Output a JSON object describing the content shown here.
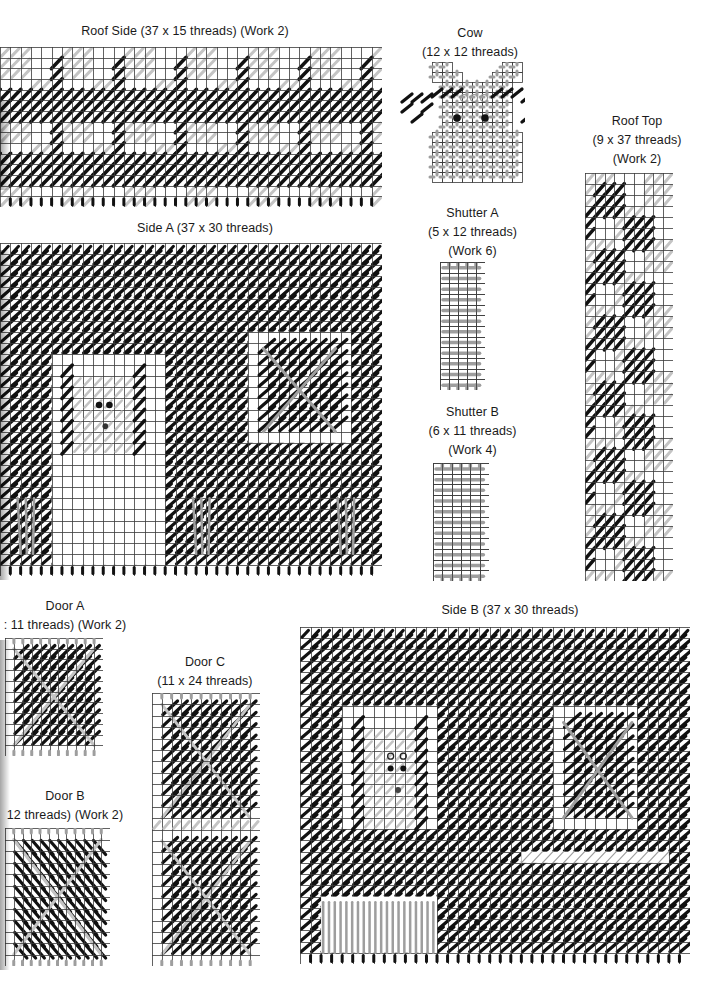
{
  "page": {
    "background": "#ffffff"
  },
  "colors": {
    "grid": "#3a3a3a",
    "dark_stitch": "#111111",
    "gray_stitch": "#9e9e9e",
    "light_stitch": "#c4c4c4"
  },
  "charts": [
    {
      "id": "roof-side",
      "title_lines": [
        "Roof Side (37 x 15 threads) (Work 2)"
      ],
      "threads_w": 37,
      "threads_h": 15,
      "work": 2,
      "title_box": {
        "x": 20,
        "y": 22,
        "w": 330
      },
      "grid_box": {
        "x": 0,
        "y": 47,
        "w": 382,
        "h": 160
      },
      "pattern": "plaid"
    },
    {
      "id": "cow",
      "title_lines": [
        "Cow",
        "(12 x 12 threads)"
      ],
      "threads_w": 12,
      "threads_h": 12,
      "title_box": {
        "x": 405,
        "y": 24,
        "w": 130
      },
      "grid_box": {
        "x": 400,
        "y": 62,
        "w": 125,
        "h": 130
      },
      "pattern": "cow"
    },
    {
      "id": "roof-top",
      "title_lines": [
        "Roof Top",
        "(9 x 37 threads)",
        "(Work 2)"
      ],
      "threads_w": 9,
      "threads_h": 37,
      "work": 2,
      "title_box": {
        "x": 575,
        "y": 112,
        "w": 124
      },
      "grid_box": {
        "x": 585,
        "y": 173,
        "w": 88,
        "h": 408
      },
      "pattern": "plaid-vertical"
    },
    {
      "id": "side-a",
      "title_lines": [
        "Side A (37 x 30 threads)"
      ],
      "threads_w": 37,
      "threads_h": 30,
      "title_box": {
        "x": 80,
        "y": 219,
        "w": 250
      },
      "grid_box": {
        "x": 0,
        "y": 243,
        "w": 382,
        "h": 333
      },
      "pattern": "side-a"
    },
    {
      "id": "shutter-a",
      "title_lines": [
        "Shutter A",
        "(5 x 12 threads)",
        "(Work 6)"
      ],
      "threads_w": 5,
      "threads_h": 12,
      "work": 6,
      "title_box": {
        "x": 410,
        "y": 204,
        "w": 125
      },
      "grid_box": {
        "x": 440,
        "y": 262,
        "w": 45,
        "h": 128
      },
      "pattern": "shutter"
    },
    {
      "id": "shutter-b",
      "title_lines": [
        "Shutter B",
        "(6 x 11 threads)",
        "(Work 4)"
      ],
      "threads_w": 6,
      "threads_h": 11,
      "work": 4,
      "title_box": {
        "x": 410,
        "y": 403,
        "w": 125
      },
      "grid_box": {
        "x": 433,
        "y": 463,
        "w": 56,
        "h": 118
      },
      "pattern": "shutter"
    },
    {
      "id": "door-a",
      "title_lines": [
        "Door A",
        ": 11 threads) (Work 2)"
      ],
      "threads_w": 11,
      "threads_h": 11,
      "work": 2,
      "title_box": {
        "x": 0,
        "y": 597,
        "w": 130
      },
      "grid_box": {
        "x": 5,
        "y": 638,
        "w": 98,
        "h": 118
      },
      "pattern": "door"
    },
    {
      "id": "door-b",
      "title_lines": [
        "Door B",
        "12 threads) (Work 2)"
      ],
      "threads_w": 12,
      "threads_h": 12,
      "work": 2,
      "title_box": {
        "x": 0,
        "y": 787,
        "w": 130
      },
      "grid_box": {
        "x": 5,
        "y": 828,
        "w": 105,
        "h": 138
      },
      "pattern": "door-b"
    },
    {
      "id": "door-c",
      "title_lines": [
        "Door C",
        "(11 x 24 threads)"
      ],
      "threads_w": 11,
      "threads_h": 24,
      "title_box": {
        "x": 150,
        "y": 653,
        "w": 110
      },
      "grid_box": {
        "x": 152,
        "y": 693,
        "w": 108,
        "h": 273
      },
      "pattern": "door-c"
    },
    {
      "id": "side-b",
      "title_lines": [
        "Side B (37 x 30 threads)"
      ],
      "threads_w": 37,
      "threads_h": 30,
      "title_box": {
        "x": 400,
        "y": 601,
        "w": 220
      },
      "grid_box": {
        "x": 300,
        "y": 627,
        "w": 390,
        "h": 337
      },
      "pattern": "side-b"
    }
  ]
}
